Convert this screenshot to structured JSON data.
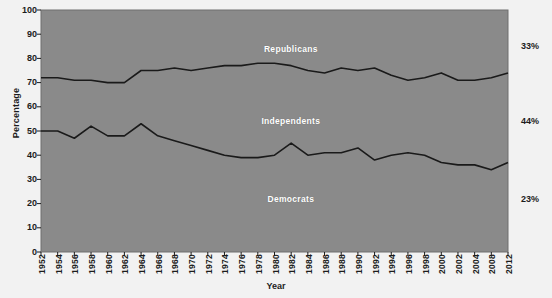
{
  "chart_data": {
    "type": "area",
    "title": "",
    "xlabel": "Year",
    "ylabel": "Percentage",
    "ylim": [
      0,
      100
    ],
    "ytick_step": 10,
    "yticks": [
      100,
      90,
      80,
      70,
      60,
      50,
      40,
      30,
      20,
      10,
      0
    ],
    "grid": false,
    "legend_position": "inline-band-labels",
    "plot_background_color": "#8a8a8a",
    "line_color": "#1a1a1a",
    "x": [
      1952,
      1954,
      1956,
      1958,
      1960,
      1962,
      1964,
      1966,
      1968,
      1970,
      1972,
      1974,
      1976,
      1978,
      1980,
      1982,
      1984,
      1986,
      1988,
      1990,
      1992,
      1994,
      1996,
      1998,
      2000,
      2002,
      2004,
      2008,
      2012
    ],
    "xtick_labels": [
      "1952",
      "1954",
      "1956",
      "1958",
      "1960",
      "1962",
      "1964",
      "1966",
      "1968",
      "1970",
      "1972",
      "1974",
      "1976",
      "1978",
      "1980",
      "1982",
      "1984",
      "1986",
      "1988",
      "1990",
      "1992",
      "1994",
      "1996",
      "1998",
      "2000",
      "2002",
      "2004",
      "2008",
      "2012"
    ],
    "series": [
      {
        "name": "Democrats",
        "band": "bottom",
        "note": "cumulative lower boundary line values (Democrat share)",
        "values": [
          50,
          50,
          47,
          52,
          48,
          48,
          53,
          48,
          46,
          44,
          42,
          40,
          39,
          39,
          40,
          45,
          40,
          41,
          41,
          43,
          38,
          40,
          41,
          40,
          37,
          36,
          36,
          34,
          37
        ]
      },
      {
        "name": "Independents",
        "band": "middle",
        "note": "cumulative upper boundary line values (Democrats + Independents)",
        "values": [
          72,
          72,
          71,
          71,
          70,
          70,
          75,
          75,
          76,
          75,
          76,
          77,
          77,
          78,
          78,
          77,
          75,
          74,
          76,
          75,
          76,
          73,
          71,
          72,
          74,
          71,
          71,
          72,
          74
        ]
      },
      {
        "name": "Republicans",
        "band": "top",
        "note": "remainder above the upper boundary line up to 100",
        "values": [
          28,
          28,
          29,
          29,
          30,
          30,
          25,
          25,
          24,
          25,
          24,
          23,
          23,
          22,
          22,
          23,
          25,
          26,
          24,
          25,
          24,
          27,
          29,
          28,
          26,
          29,
          29,
          28,
          26
        ]
      }
    ],
    "band_labels": [
      {
        "text": "Republicans",
        "x_frac": 0.535,
        "y_value": 84
      },
      {
        "text": "Independents",
        "x_frac": 0.535,
        "y_value": 54
      },
      {
        "text": "Democrats",
        "x_frac": 0.535,
        "y_value": 22
      }
    ],
    "edge_annotations": [
      {
        "text": "33%",
        "y_value": 85
      },
      {
        "text": "44%",
        "y_value": 54
      },
      {
        "text": "23%",
        "y_value": 22
      }
    ]
  }
}
